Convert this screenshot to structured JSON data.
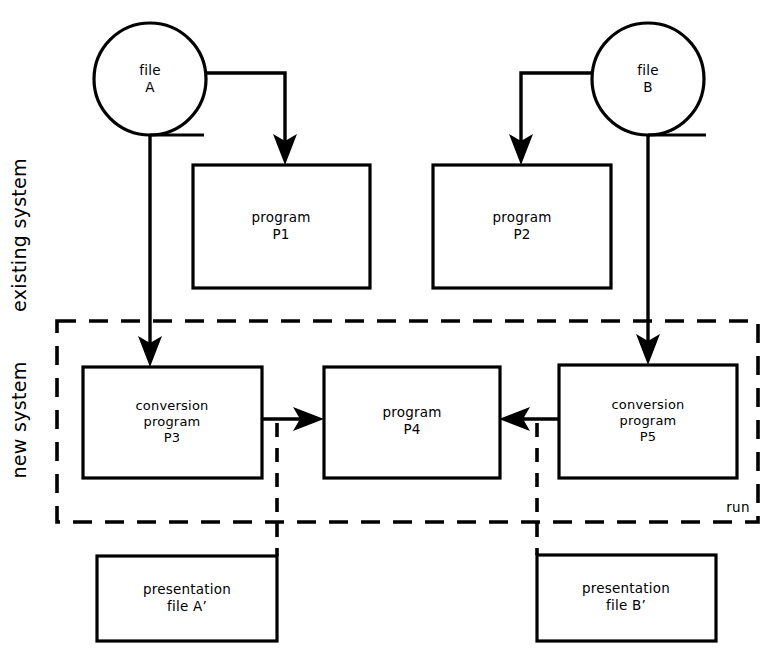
{
  "diagram": {
    "background_color": "#ffffff",
    "stroke_color": "#000000",
    "side_labels": {
      "existing": "existing system",
      "new": "new system"
    },
    "boundary": {
      "label": "run",
      "style": "dashed"
    },
    "nodes": {
      "file_a": {
        "line1": "file",
        "line2": "A",
        "shape": "circle"
      },
      "file_b": {
        "line1": "file",
        "line2": "B",
        "shape": "circle"
      },
      "p1": {
        "line1": "program",
        "line2": "P1",
        "shape": "rectangle"
      },
      "p2": {
        "line1": "program",
        "line2": "P2",
        "shape": "rectangle"
      },
      "p3": {
        "line1": "conversion",
        "line2": "program",
        "line3": "P3",
        "shape": "rectangle"
      },
      "p4": {
        "line1": "program",
        "line2": "P4",
        "shape": "rectangle"
      },
      "p5": {
        "line1": "conversion",
        "line2": "program",
        "line3": "P5",
        "shape": "rectangle"
      },
      "pres_a": {
        "line1": "presentation",
        "line2": "file A’",
        "shape": "rectangle"
      },
      "pres_b": {
        "line1": "presentation",
        "line2": "file B’",
        "shape": "rectangle"
      }
    },
    "edges": [
      {
        "from": "file_a",
        "to": "p1",
        "style": "solid",
        "arrow": "down"
      },
      {
        "from": "file_a",
        "to": "p3",
        "style": "solid",
        "arrow": "down"
      },
      {
        "from": "file_b",
        "to": "p2",
        "style": "solid",
        "arrow": "down"
      },
      {
        "from": "file_b",
        "to": "p5",
        "style": "solid",
        "arrow": "down"
      },
      {
        "from": "p3",
        "to": "p4",
        "style": "solid",
        "arrow": "right"
      },
      {
        "from": "p5",
        "to": "p4",
        "style": "solid",
        "arrow": "left"
      },
      {
        "from": "p3",
        "to": "pres_a",
        "style": "dashed",
        "arrow": "none"
      },
      {
        "from": "p5",
        "to": "pres_b",
        "style": "dashed",
        "arrow": "none"
      }
    ]
  }
}
